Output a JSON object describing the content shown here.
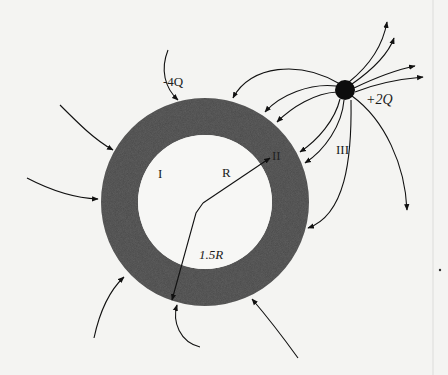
{
  "diagram": {
    "type": "electric-field-lines",
    "colors": {
      "background": "#f4f4f2",
      "shell": "#4a4a4a",
      "ink": "#111111"
    },
    "shell": {
      "charge_label": "-4Q",
      "inner_radius_label": "R",
      "outer_radius_label": "1.5R"
    },
    "point_charge": {
      "label": "+2Q"
    },
    "regions": {
      "region_1": "I",
      "region_2": "II",
      "region_3": "III"
    }
  }
}
